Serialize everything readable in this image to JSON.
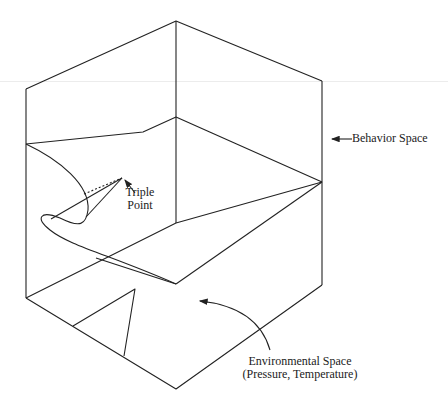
{
  "figure": {
    "line_color": "#222222",
    "background": "#ffffff"
  },
  "labels": {
    "behavior_space": "Behavior Space",
    "triple_point_line1": "Triple",
    "triple_point_line2": "Point",
    "environmental_space_line1": "Environmental Space",
    "environmental_space_line2": "(Pressure, Temperature)"
  }
}
